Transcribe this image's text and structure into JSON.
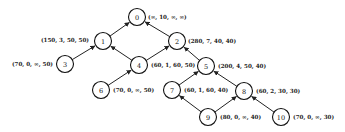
{
  "diagram": {
    "type": "tree",
    "nodes": [
      {
        "id": "0",
        "x": 137,
        "y": 17,
        "label": "(∞, 10, ∞, ∞)",
        "lx": 148,
        "ly": 17,
        "anchor": "start"
      },
      {
        "id": "1",
        "x": 103,
        "y": 41,
        "label": "(150, 3, 50, 50)",
        "lx": 89,
        "ly": 40,
        "anchor": "end"
      },
      {
        "id": "2",
        "x": 177,
        "y": 41,
        "label": "(280, 7, 40, 40)",
        "lx": 188,
        "ly": 41,
        "anchor": "start"
      },
      {
        "id": "3",
        "x": 65,
        "y": 64,
        "label": "(70, 0, ∞, 50)",
        "lx": 53,
        "ly": 64,
        "anchor": "end"
      },
      {
        "id": "4",
        "x": 139,
        "y": 65,
        "label": "(60, 1, 60, 50)",
        "lx": 151,
        "ly": 65,
        "anchor": "start"
      },
      {
        "id": "5",
        "x": 206,
        "y": 66,
        "label": "(200, 4, 50, 40)",
        "lx": 218,
        "ly": 66,
        "anchor": "start"
      },
      {
        "id": "6",
        "x": 101,
        "y": 90,
        "label": "(70, 0, ∞, 50)",
        "lx": 113,
        "ly": 90,
        "anchor": "start"
      },
      {
        "id": "7",
        "x": 172,
        "y": 90,
        "label": "(60, 1, 60, 40)",
        "lx": 184,
        "ly": 90,
        "anchor": "start"
      },
      {
        "id": "8",
        "x": 244,
        "y": 91,
        "label": "(60, 2, 30, 30)",
        "lx": 256,
        "ly": 91,
        "anchor": "start"
      },
      {
        "id": "9",
        "x": 208,
        "y": 117,
        "label": "(80, 0, ∞, 40)",
        "lx": 220,
        "ly": 117,
        "anchor": "start"
      },
      {
        "id": "10",
        "x": 281,
        "y": 117,
        "label": "(70, 0, ∞, 30)",
        "lx": 293,
        "ly": 117,
        "anchor": "start"
      }
    ],
    "edges": [
      {
        "from": "1",
        "to": "0"
      },
      {
        "from": "2",
        "to": "0"
      },
      {
        "from": "3",
        "to": "1"
      },
      {
        "from": "4",
        "to": "1"
      },
      {
        "from": "4",
        "to": "2"
      },
      {
        "from": "5",
        "to": "2"
      },
      {
        "from": "6",
        "to": "4"
      },
      {
        "from": "7",
        "to": "5"
      },
      {
        "from": "8",
        "to": "5"
      },
      {
        "from": "9",
        "to": "7"
      },
      {
        "from": "9",
        "to": "8"
      },
      {
        "from": "10",
        "to": "8"
      }
    ],
    "node_radius": 8.5
  }
}
